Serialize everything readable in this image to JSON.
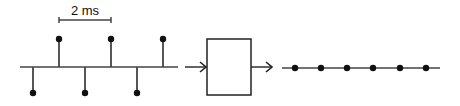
{
  "scale_bar": {
    "label": "2 ms",
    "x1": 59,
    "x2": 111,
    "y": 20
  },
  "input_signal": {
    "baseline": {
      "x1": 20,
      "x2": 178,
      "y": 67
    },
    "samples": [
      {
        "x": 33,
        "direction": "down",
        "tip_y": 93
      },
      {
        "x": 59,
        "direction": "up",
        "tip_y": 39
      },
      {
        "x": 85,
        "direction": "down",
        "tip_y": 93
      },
      {
        "x": 111,
        "direction": "up",
        "tip_y": 39
      },
      {
        "x": 137,
        "direction": "down",
        "tip_y": 93
      },
      {
        "x": 163,
        "direction": "up",
        "tip_y": 39
      }
    ]
  },
  "block": {
    "x": 207,
    "y": 39,
    "width": 44,
    "height": 56,
    "label": ""
  },
  "arrows": [
    {
      "x1": 185,
      "x2": 206,
      "y": 67
    },
    {
      "x1": 251,
      "x2": 272,
      "y": 67
    }
  ],
  "output_signal": {
    "baseline": {
      "x1": 282,
      "x2": 440,
      "y": 68
    },
    "samples": [
      {
        "x": 295
      },
      {
        "x": 321
      },
      {
        "x": 347
      },
      {
        "x": 373
      },
      {
        "x": 400
      },
      {
        "x": 426
      }
    ]
  },
  "colors": {
    "line": "#444444",
    "dot": "#111111",
    "box": "#222222"
  }
}
